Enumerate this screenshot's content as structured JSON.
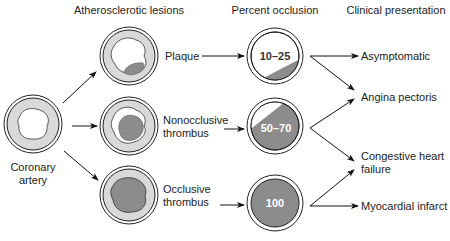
{
  "headers": {
    "lesions": "Atherosclerotic lesions",
    "occlusion": "Percent occlusion",
    "clinical": "Clinical presentation"
  },
  "start": {
    "label_line1": "Coronary",
    "label_line2": "artery"
  },
  "lesions": [
    {
      "line1": "Plaque",
      "line2": ""
    },
    {
      "line1": "Nonocclusive",
      "line2": "thrombus"
    },
    {
      "line1": "Occlusive",
      "line2": "thrombus"
    }
  ],
  "occlusions": [
    {
      "value": "10–25",
      "text_color": "#333333"
    },
    {
      "value": "50–70",
      "text_color": "#ffffff"
    },
    {
      "value": "100",
      "text_color": "#ffffff"
    }
  ],
  "clinical": [
    {
      "line1": "Asymptomatic",
      "line2": ""
    },
    {
      "line1": "Angina pectoris",
      "line2": ""
    },
    {
      "line1": "Congestive heart",
      "line2": "failure"
    },
    {
      "line1": "Myocardial infarct",
      "line2": ""
    }
  ],
  "colors": {
    "vessel_wall": "#d9d9d9",
    "thrombus": "#8c8c8c",
    "stroke": "#222222"
  }
}
